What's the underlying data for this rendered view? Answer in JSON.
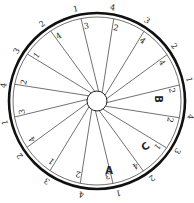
{
  "diagram": {
    "title": "",
    "spoke_count": 16,
    "outer_labels": [
      "1",
      "4",
      "3",
      "2",
      "1",
      "4",
      "3",
      "2",
      "1",
      "4",
      "3",
      "2",
      "1",
      "4",
      "3",
      "2"
    ],
    "inner_labels": [
      "3",
      "2",
      "4",
      "4",
      "2",
      "2",
      "1",
      "4",
      "3",
      "2",
      "1",
      "4",
      "3",
      "2",
      "1",
      "4"
    ],
    "letter_labels": [
      {
        "text": "B",
        "position": "right"
      },
      {
        "text": "C",
        "position": "lower-right"
      },
      {
        "text": "A",
        "position": "bottom"
      }
    ],
    "colors": {
      "ink": "#222222",
      "background": "#ffffff"
    }
  }
}
